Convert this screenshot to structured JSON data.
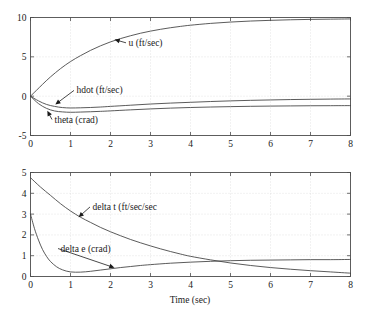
{
  "figure": {
    "background": "#ffffff",
    "axis_color": "#4d4d4d",
    "grid_color": "#c8c8c8",
    "curve_color": "#3d3d3d"
  },
  "chart_data": [
    {
      "type": "line",
      "id": "upper-plot",
      "title": "",
      "xlabel": "",
      "ylabel": "",
      "xlim": [
        0,
        8
      ],
      "ylim": [
        -5,
        10
      ],
      "xticks": [
        0,
        1,
        2,
        3,
        4,
        5,
        6,
        7,
        8
      ],
      "xticklabels": [
        "0",
        "1",
        "2",
        "3",
        "4",
        "5",
        "6",
        "7",
        "8"
      ],
      "yticks": [
        -5,
        0,
        5,
        10
      ],
      "yticklabels": [
        "-5",
        "0",
        "5",
        "10"
      ],
      "grid": true,
      "legend": "inline-annotations",
      "series": [
        {
          "name": "u (ft/sec)",
          "label": "u (ft/sec)",
          "x": [
            0,
            0.15,
            0.3,
            0.5,
            0.75,
            1.0,
            1.25,
            1.5,
            1.75,
            2.0,
            2.25,
            2.5,
            2.75,
            3.0,
            3.25,
            3.5,
            3.75,
            4.0,
            4.5,
            5.0,
            5.5,
            6.0,
            6.5,
            7.0,
            7.5,
            8.0
          ],
          "values": [
            0.0,
            0.75,
            1.5,
            2.45,
            3.5,
            4.4,
            5.15,
            5.82,
            6.4,
            6.9,
            7.32,
            7.68,
            8.0,
            8.27,
            8.5,
            8.7,
            8.87,
            9.02,
            9.25,
            9.42,
            9.55,
            9.64,
            9.71,
            9.76,
            9.79,
            9.82
          ]
        },
        {
          "name": "hdot (ft/sec)",
          "label": "hdot (ft/sec)",
          "x": [
            0,
            0.2,
            0.4,
            0.6,
            0.8,
            1.0,
            1.25,
            1.5,
            1.75,
            2.0,
            2.5,
            3.0,
            3.5,
            4.0,
            4.5,
            5.0,
            5.5,
            6.0,
            6.5,
            7.0,
            7.5,
            8.0
          ],
          "values": [
            0.0,
            -0.6,
            -1.05,
            -1.3,
            -1.45,
            -1.5,
            -1.48,
            -1.44,
            -1.38,
            -1.3,
            -1.15,
            -1.0,
            -0.88,
            -0.78,
            -0.68,
            -0.6,
            -0.53,
            -0.48,
            -0.43,
            -0.4,
            -0.37,
            -0.35
          ]
        },
        {
          "name": "theta (crad)",
          "label": "theta (crad)",
          "x": [
            0,
            0.2,
            0.4,
            0.6,
            0.8,
            1.0,
            1.25,
            1.5,
            1.75,
            2.0,
            2.5,
            3.0,
            3.5,
            4.0,
            4.5,
            5.0,
            5.5,
            6.0,
            6.5,
            7.0,
            7.5,
            8.0
          ],
          "values": [
            0.0,
            -0.95,
            -1.55,
            -1.88,
            -2.0,
            -2.05,
            -2.02,
            -1.98,
            -1.93,
            -1.87,
            -1.74,
            -1.62,
            -1.52,
            -1.44,
            -1.38,
            -1.33,
            -1.29,
            -1.26,
            -1.24,
            -1.22,
            -1.21,
            -1.2
          ]
        }
      ],
      "annotations": [
        {
          "text": "u (ft/sec)",
          "x": 2.45,
          "y": 6.4,
          "point_x": 2.1,
          "point_y": 7.2
        },
        {
          "text": "hdot (ft/sec)",
          "x": 1.15,
          "y": 0.35,
          "point_x": 0.62,
          "point_y": -1.05
        },
        {
          "text": "theta (crad)",
          "x": 0.6,
          "y": -3.35,
          "point_x": 0.42,
          "point_y": -1.85
        }
      ]
    },
    {
      "type": "line",
      "id": "lower-plot",
      "title": "",
      "xlabel": "Time (sec)",
      "ylabel": "",
      "xlim": [
        0,
        8
      ],
      "ylim": [
        0,
        5
      ],
      "xticks": [
        0,
        1,
        2,
        3,
        4,
        5,
        6,
        7,
        8
      ],
      "xticklabels": [
        "0",
        "1",
        "2",
        "3",
        "4",
        "5",
        "6",
        "7",
        "8"
      ],
      "yticks": [
        0,
        1,
        2,
        3,
        4,
        5
      ],
      "yticklabels": [
        "0",
        "1",
        "2",
        "3",
        "4",
        "5"
      ],
      "grid": true,
      "legend": "inline-annotations",
      "series": [
        {
          "name": "delta t (ft/sec/sec",
          "label": "delta t (ft/sec/sec",
          "x": [
            0,
            0.25,
            0.5,
            0.75,
            1.0,
            1.25,
            1.5,
            1.75,
            2.0,
            2.25,
            2.5,
            2.75,
            3.0,
            3.25,
            3.5,
            3.75,
            4.0,
            4.5,
            5.0,
            5.5,
            6.0,
            6.5,
            7.0,
            7.5,
            8.0
          ],
          "values": [
            4.75,
            4.3,
            3.9,
            3.5,
            3.15,
            2.85,
            2.6,
            2.36,
            2.15,
            1.96,
            1.78,
            1.62,
            1.47,
            1.33,
            1.2,
            1.08,
            0.97,
            0.8,
            0.65,
            0.53,
            0.43,
            0.35,
            0.28,
            0.22,
            0.16
          ]
        },
        {
          "name": "delta e (crad)",
          "label": "delta e (crad)",
          "x": [
            0,
            0.1,
            0.2,
            0.3,
            0.4,
            0.5,
            0.65,
            0.8,
            1.0,
            1.25,
            1.5,
            1.75,
            2.0,
            2.25,
            2.5,
            2.75,
            3.0,
            3.5,
            4.0,
            4.5,
            5.0,
            5.5,
            6.0,
            6.5,
            7.0,
            7.5,
            8.0
          ],
          "values": [
            3.0,
            2.3,
            1.75,
            1.3,
            0.97,
            0.72,
            0.47,
            0.32,
            0.22,
            0.21,
            0.25,
            0.31,
            0.37,
            0.43,
            0.48,
            0.53,
            0.57,
            0.64,
            0.69,
            0.73,
            0.76,
            0.78,
            0.79,
            0.8,
            0.81,
            0.81,
            0.82
          ]
        }
      ],
      "annotations": [
        {
          "text": "delta t (ft/sec/sec",
          "x": 1.55,
          "y": 3.2,
          "point_x": 1.2,
          "point_y": 2.85
        },
        {
          "text": "delta e (crad)",
          "x": 0.75,
          "y": 1.2,
          "point_x": 2.1,
          "point_y": 0.42
        }
      ]
    }
  ]
}
